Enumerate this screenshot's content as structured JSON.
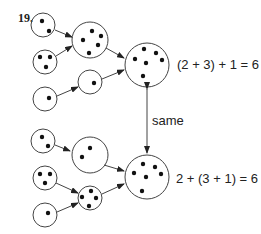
{
  "problem_number": "19.",
  "top_equation": "(2 + 3) + 1 = 6",
  "bottom_equation": "2 + (3 + 1) = 6",
  "link_label": "same",
  "top_group": {
    "inputs": [
      {
        "dots": 2
      },
      {
        "dots": 3
      },
      {
        "dots": 1
      }
    ],
    "intermediate": [
      {
        "dots": 5,
        "from": "2 + 3"
      },
      {
        "dots": 1
      }
    ],
    "result": {
      "dots": 6
    }
  },
  "bottom_group": {
    "inputs": [
      {
        "dots": 2
      },
      {
        "dots": 3
      },
      {
        "dots": 1
      }
    ],
    "intermediate": [
      {
        "dots": 2
      },
      {
        "dots": 4,
        "from": "3 + 1"
      }
    ],
    "result": {
      "dots": 6
    }
  }
}
